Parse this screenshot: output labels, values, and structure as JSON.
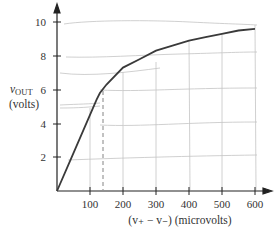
{
  "chart_data": {
    "type": "line",
    "title": "",
    "xlabel": "(v₊ − v₋) (microvolts)",
    "ylabel_main": "v",
    "ylabel_sub": "OUT",
    "ylabel_units": "(volts)",
    "x_ticks": [
      "100",
      "200",
      "300",
      "400",
      "500",
      "600"
    ],
    "y_ticks": [
      "2",
      "4",
      "6",
      "8",
      "10"
    ],
    "xlim": [
      0,
      620
    ],
    "ylim": [
      0,
      10.5
    ],
    "grid": false,
    "legend": null,
    "series": [
      {
        "name": "vOUT",
        "x": [
          0,
          40,
          80,
          120,
          130,
          150,
          200,
          250,
          300,
          350,
          400,
          450,
          500,
          550,
          600
        ],
        "y": [
          0,
          1.8,
          3.6,
          5.4,
          5.8,
          6.3,
          7.3,
          7.8,
          8.3,
          8.6,
          8.9,
          9.1,
          9.3,
          9.5,
          9.6
        ]
      }
    ],
    "annotations": [
      {
        "type": "dashed-vertical-line",
        "x": 140,
        "y_top": 5.95
      }
    ],
    "colors": {
      "curve": "#3a3a3a",
      "axis": "#222222",
      "sketch_lines": "#bdbdbd"
    }
  }
}
